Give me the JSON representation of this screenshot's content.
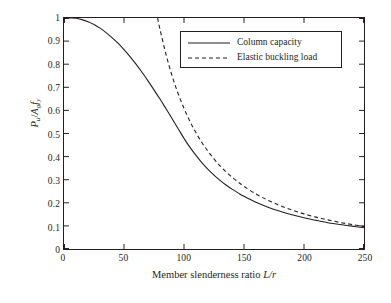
{
  "chart_data": {
    "type": "line",
    "title": "",
    "subtitle": "",
    "xlabel_plain": "Member slenderness ratio L/r",
    "xlabel_prefix": "Member slenderness ratio ",
    "xlabel_symbol": "L/r",
    "ylabel_plain": "Pu/Ag fy",
    "ylabel_parts": {
      "p": "P",
      "p_sub": "u",
      "slash": "/",
      "a": "A",
      "a_sub": "g",
      "f": "f",
      "f_sub": "y"
    },
    "xlim": [
      0,
      250
    ],
    "ylim": [
      0,
      1
    ],
    "xticks": [
      0,
      50,
      100,
      150,
      200,
      250
    ],
    "xtick_labels": [
      "0",
      "50",
      "100",
      "150",
      "200",
      "250"
    ],
    "yticks": [
      0,
      0.1,
      0.2,
      0.3,
      0.4,
      0.5,
      0.6,
      0.7,
      0.8,
      0.9,
      1
    ],
    "ytick_labels": [
      "0",
      "0.1",
      "0.2",
      "0.3",
      "0.4",
      "0.5",
      "0.6",
      "0.7",
      "0.8",
      "0.9",
      "1"
    ],
    "grid": false,
    "legend_position": "upper right",
    "axis_color": "#231f20",
    "background_color": "#ffffff",
    "series": [
      {
        "name": "Column capacity",
        "style": "solid",
        "color": "#231f20",
        "width": 1.1,
        "x": [
          0,
          5,
          10,
          15,
          20,
          25,
          30,
          35,
          40,
          45,
          50,
          55,
          60,
          65,
          70,
          75,
          80,
          85,
          90,
          95,
          100,
          105,
          110,
          115,
          120,
          125,
          130,
          135,
          140,
          145,
          150,
          160,
          170,
          180,
          190,
          200,
          210,
          220,
          230,
          240,
          250
        ],
        "y": [
          1.0,
          1.0,
          0.999,
          0.993,
          0.984,
          0.972,
          0.956,
          0.937,
          0.915,
          0.891,
          0.863,
          0.833,
          0.8,
          0.765,
          0.728,
          0.689,
          0.649,
          0.607,
          0.565,
          0.522,
          0.479,
          0.44,
          0.405,
          0.373,
          0.345,
          0.32,
          0.297,
          0.277,
          0.259,
          0.243,
          0.228,
          0.202,
          0.181,
          0.163,
          0.148,
          0.135,
          0.124,
          0.114,
          0.106,
          0.099,
          0.092
        ]
      },
      {
        "name": "Elastic buckling load",
        "style": "dashed",
        "color": "#231f20",
        "width": 1.1,
        "dash_pattern": "4,3",
        "x": [
          78,
          80,
          85,
          90,
          95,
          100,
          105,
          110,
          115,
          120,
          125,
          130,
          135,
          140,
          145,
          150,
          160,
          170,
          180,
          190,
          200,
          210,
          220,
          230,
          240,
          250
        ],
        "y": [
          1.0,
          0.951,
          0.842,
          0.751,
          0.674,
          0.609,
          0.552,
          0.503,
          0.46,
          0.423,
          0.39,
          0.36,
          0.334,
          0.311,
          0.29,
          0.271,
          0.238,
          0.211,
          0.188,
          0.169,
          0.152,
          0.138,
          0.126,
          0.115,
          0.106,
          0.097
        ]
      }
    ],
    "legend": [
      {
        "label": "Column capacity",
        "style": "solid"
      },
      {
        "label": "Elastic buckling load",
        "style": "dashed"
      }
    ]
  }
}
